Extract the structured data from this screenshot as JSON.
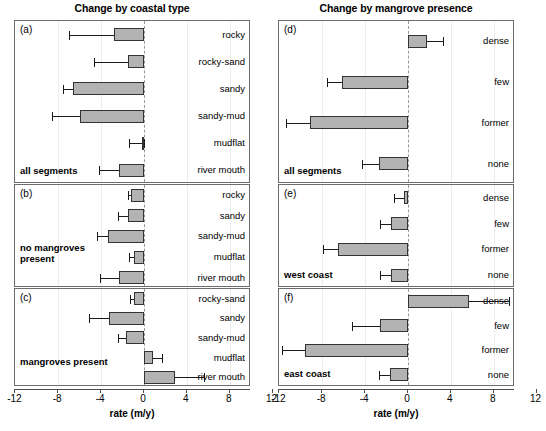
{
  "figure": {
    "left_column_title": "Change by coastal type",
    "right_column_title": "Change by mangrove presence",
    "axis_title": "rate (m/y)",
    "tick_labels": [
      "-12",
      "-8",
      "-4",
      "0",
      "4",
      "8",
      "12"
    ],
    "bar_fill_color": "#b3b3b3",
    "bar_edge_color": "#333333",
    "zero_line_color": "#9a9a9a"
  },
  "chart_data": [
    {
      "type": "bar",
      "panel": "a",
      "title": "Change by coastal type",
      "group_label": "all segments",
      "xlabel": "rate (m/y)",
      "ylabel": "",
      "xlim": [
        -12,
        12
      ],
      "orientation": "horizontal",
      "grid": false,
      "legend": "none",
      "categories": [
        "rocky",
        "rocky-sand",
        "sandy",
        "sandy-mud",
        "mudflat",
        "river mouth"
      ],
      "values": [
        -2.8,
        -1.5,
        -6.6,
        -6.0,
        -0.2,
        -2.3
      ],
      "err_low": [
        -7.0,
        -4.7,
        -7.6,
        -8.6,
        -1.4,
        -4.2
      ],
      "err_high": [
        -2.8,
        -1.5,
        -6.6,
        -6.0,
        0.0,
        -2.3
      ]
    },
    {
      "type": "bar",
      "panel": "b",
      "group_label": "no mangroves present",
      "xlabel": "rate (m/y)",
      "xlim": [
        -12,
        12
      ],
      "orientation": "horizontal",
      "grid": false,
      "legend": "none",
      "categories": [
        "rocky",
        "sandy",
        "sandy-mud",
        "mudflat",
        "river mouth"
      ],
      "values": [
        -1.2,
        -1.5,
        -3.4,
        -0.9,
        -2.3
      ],
      "err_low": [
        -1.5,
        -2.4,
        -4.4,
        -1.4,
        -4.1
      ],
      "err_high": [
        -1.2,
        -1.5,
        -3.4,
        -0.9,
        -2.3
      ]
    },
    {
      "type": "bar",
      "panel": "c",
      "group_label": "mangroves present",
      "xlabel": "rate (m/y)",
      "xlim": [
        -12,
        12
      ],
      "orientation": "horizontal",
      "grid": false,
      "legend": "none",
      "categories": [
        "rocky-sand",
        "sandy",
        "sandy-mud",
        "mudflat",
        "river mouth"
      ],
      "values": [
        -0.9,
        -3.3,
        -1.7,
        0.8,
        2.9
      ],
      "err_low": [
        -1.3,
        -5.1,
        -2.4,
        0.0,
        2.9
      ],
      "err_high": [
        -0.9,
        -3.3,
        -1.7,
        1.7,
        5.6
      ]
    },
    {
      "type": "bar",
      "panel": "d",
      "title": "Change by mangrove presence",
      "group_label": "all segments",
      "xlabel": "rate (m/y)",
      "xlim": [
        -12,
        12
      ],
      "orientation": "horizontal",
      "grid": false,
      "legend": "none",
      "categories": [
        "dense",
        "few",
        "former",
        "none"
      ],
      "values": [
        1.8,
        -6.2,
        -9.1,
        -2.7
      ],
      "err_low": [
        1.8,
        -7.6,
        -11.4,
        -4.3
      ],
      "err_high": [
        3.3,
        -6.2,
        -9.1,
        -2.7
      ]
    },
    {
      "type": "bar",
      "panel": "e",
      "group_label": "west coast",
      "xlabel": "rate (m/y)",
      "xlim": [
        -12,
        12
      ],
      "orientation": "horizontal",
      "grid": false,
      "legend": "none",
      "categories": [
        "dense",
        "few",
        "former",
        "none"
      ],
      "values": [
        -0.4,
        -1.6,
        -6.5,
        -1.6
      ],
      "err_low": [
        -1.3,
        -2.6,
        -7.9,
        -2.6
      ],
      "err_high": [
        -0.4,
        -1.6,
        -6.5,
        -1.6
      ]
    },
    {
      "type": "bar",
      "panel": "f",
      "group_label": "east coast",
      "xlabel": "rate (m/y)",
      "xlim": [
        -12,
        12
      ],
      "orientation": "horizontal",
      "grid": false,
      "legend": "none",
      "categories": [
        "dense",
        "few",
        "former",
        "none"
      ],
      "values": [
        5.7,
        -2.6,
        -9.6,
        -1.7
      ],
      "err_low": [
        5.7,
        -5.2,
        -11.8,
        -2.7
      ],
      "err_high": [
        9.4,
        -2.6,
        -9.6,
        -1.7
      ]
    }
  ]
}
